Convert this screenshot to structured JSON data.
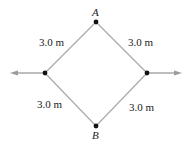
{
  "diagram": {
    "points": {
      "A": {
        "label": "A",
        "x": 96,
        "y": 22
      },
      "B": {
        "label": "B",
        "x": 96,
        "y": 126
      },
      "left": {
        "x": 45,
        "y": 73
      },
      "right": {
        "x": 147,
        "y": 73
      }
    },
    "side_labels": {
      "top_left": "3.0 m",
      "top_right": "3.0 m",
      "bottom_left": "3.0 m",
      "bottom_right": "3.0 m"
    },
    "arrows": [
      {
        "from": "left",
        "direction": "left"
      },
      {
        "from": "right",
        "direction": "right"
      }
    ],
    "colors": {
      "edge": "#a9a9a9",
      "dot": "#111111",
      "arrow": "#9a9a9a"
    }
  }
}
